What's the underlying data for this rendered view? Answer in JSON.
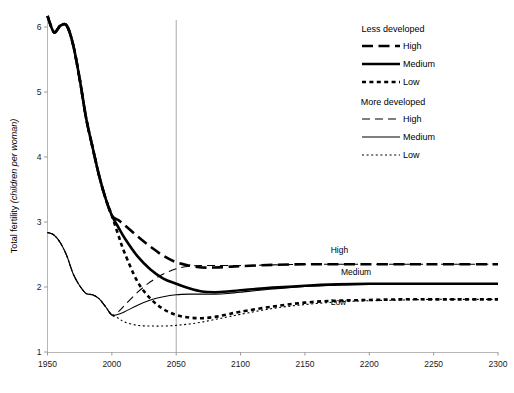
{
  "chart_data": {
    "type": "line",
    "title": "",
    "xlabel": "",
    "ylabel": "Total fertility",
    "ylabel_unit": "(children per woman)",
    "xlim": [
      1950,
      2300
    ],
    "ylim": [
      1,
      6
    ],
    "xticks": [
      "1950",
      "2000",
      "2050",
      "2100",
      "2150",
      "2200",
      "2250",
      "2300"
    ],
    "yticks": [
      "1",
      "2",
      "3",
      "4",
      "5",
      "6"
    ],
    "grid": false,
    "legend_position": "top-right",
    "reference_line": {
      "x": 2050,
      "color": "#a9a9a9",
      "label": ""
    },
    "annotations": [
      {
        "text": "High",
        "x": 2170,
        "y": 2.52
      },
      {
        "text": "Medium",
        "x": 2178,
        "y": 2.18
      },
      {
        "text": "Low",
        "x": 2170,
        "y": 1.72
      }
    ],
    "x": [
      1950,
      1955,
      1960,
      1965,
      1970,
      1975,
      1980,
      1985,
      1990,
      1995,
      2000,
      2005,
      2010,
      2020,
      2030,
      2040,
      2050,
      2060,
      2070,
      2080,
      2090,
      2100,
      2125,
      2150,
      2175,
      2200,
      2225,
      2250,
      2275,
      2300
    ],
    "series": [
      {
        "name": "Less developed High",
        "group": "Less developed",
        "variant": "High",
        "style": "thick-dash",
        "values": [
          6.17,
          5.92,
          6.02,
          6.02,
          5.72,
          5.2,
          4.6,
          4.15,
          3.72,
          3.37,
          3.1,
          3.03,
          2.95,
          2.78,
          2.62,
          2.48,
          2.38,
          2.33,
          2.3,
          2.3,
          2.31,
          2.32,
          2.34,
          2.35,
          2.35,
          2.35,
          2.35,
          2.35,
          2.35,
          2.35
        ]
      },
      {
        "name": "Less developed Medium",
        "group": "Less developed",
        "variant": "Medium",
        "style": "thick-solid",
        "values": [
          6.17,
          5.92,
          6.02,
          6.02,
          5.72,
          5.2,
          4.6,
          4.15,
          3.72,
          3.37,
          3.1,
          2.92,
          2.75,
          2.47,
          2.27,
          2.13,
          2.05,
          1.98,
          1.93,
          1.92,
          1.93,
          1.95,
          1.99,
          2.02,
          2.04,
          2.05,
          2.05,
          2.05,
          2.05,
          2.05
        ]
      },
      {
        "name": "Less developed Low",
        "group": "Less developed",
        "variant": "Low",
        "style": "thick-shortdash",
        "values": [
          6.17,
          5.92,
          6.02,
          6.02,
          5.72,
          5.2,
          4.6,
          4.15,
          3.72,
          3.37,
          3.1,
          2.8,
          2.52,
          2.08,
          1.82,
          1.66,
          1.57,
          1.53,
          1.52,
          1.54,
          1.58,
          1.62,
          1.7,
          1.76,
          1.79,
          1.8,
          1.81,
          1.81,
          1.81,
          1.81
        ]
      },
      {
        "name": "More developed High",
        "group": "More developed",
        "variant": "High",
        "style": "thin-dash",
        "values": [
          2.84,
          2.8,
          2.68,
          2.48,
          2.2,
          2.02,
          1.9,
          1.88,
          1.82,
          1.7,
          1.57,
          1.62,
          1.72,
          1.92,
          2.08,
          2.2,
          2.28,
          2.32,
          2.33,
          2.33,
          2.33,
          2.33,
          2.34,
          2.35,
          2.35,
          2.35,
          2.35,
          2.35,
          2.35,
          2.35
        ]
      },
      {
        "name": "More developed Medium",
        "group": "More developed",
        "variant": "Medium",
        "style": "thin-solid",
        "values": [
          2.84,
          2.8,
          2.68,
          2.48,
          2.2,
          2.02,
          1.9,
          1.88,
          1.82,
          1.7,
          1.57,
          1.58,
          1.62,
          1.72,
          1.8,
          1.85,
          1.88,
          1.89,
          1.89,
          1.89,
          1.9,
          1.92,
          1.97,
          2.01,
          2.03,
          2.04,
          2.05,
          2.05,
          2.05,
          2.05
        ]
      },
      {
        "name": "More developed Low",
        "group": "More developed",
        "variant": "Low",
        "style": "thin-dot",
        "values": [
          2.84,
          2.8,
          2.68,
          2.48,
          2.2,
          2.02,
          1.9,
          1.88,
          1.82,
          1.7,
          1.57,
          1.52,
          1.46,
          1.41,
          1.4,
          1.4,
          1.41,
          1.43,
          1.46,
          1.5,
          1.54,
          1.58,
          1.67,
          1.73,
          1.77,
          1.79,
          1.8,
          1.81,
          1.81,
          1.81
        ]
      }
    ]
  },
  "legend": {
    "groups": [
      {
        "heading": "Less developed",
        "items": [
          {
            "label": "High",
            "style": "thick-dash"
          },
          {
            "label": "Medium",
            "style": "thick-solid"
          },
          {
            "label": "Low",
            "style": "thick-shortdash"
          }
        ]
      },
      {
        "heading": "More developed",
        "items": [
          {
            "label": "High",
            "style": "thin-dash"
          },
          {
            "label": "Medium",
            "style": "thin-solid"
          },
          {
            "label": "Low",
            "style": "thin-dot"
          }
        ]
      }
    ]
  }
}
